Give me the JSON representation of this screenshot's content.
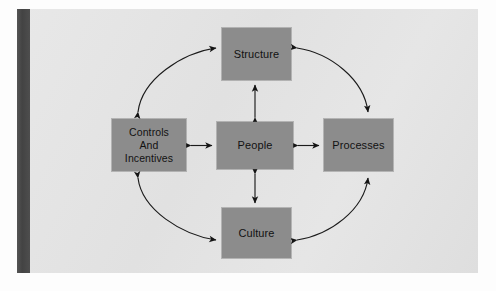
{
  "diagram": {
    "type": "cycle-with-center",
    "page_background": "#e4e4e4",
    "node_fill": "#8c8c8c",
    "node_text_color": "#121212",
    "arrow_color": "#1b1b1b",
    "spine_color": "#4a4a4a",
    "nodes": [
      {
        "id": "structure",
        "label": "Structure",
        "position": "top"
      },
      {
        "id": "controls",
        "label": "Controls\nAnd\nIncentives",
        "position": "left"
      },
      {
        "id": "people",
        "label": "People",
        "position": "center"
      },
      {
        "id": "processes",
        "label": "Processes",
        "position": "right"
      },
      {
        "id": "culture",
        "label": "Culture",
        "position": "bottom"
      }
    ],
    "edges": [
      {
        "from": "people",
        "to": "structure",
        "style": "straight",
        "arrows": "both"
      },
      {
        "from": "people",
        "to": "controls",
        "style": "straight",
        "arrows": "both"
      },
      {
        "from": "people",
        "to": "processes",
        "style": "straight",
        "arrows": "both"
      },
      {
        "from": "people",
        "to": "culture",
        "style": "straight",
        "arrows": "both"
      },
      {
        "from": "controls",
        "to": "structure",
        "style": "curved",
        "arrows": "both"
      },
      {
        "from": "structure",
        "to": "processes",
        "style": "curved",
        "arrows": "both"
      },
      {
        "from": "controls",
        "to": "culture",
        "style": "curved",
        "arrows": "both"
      },
      {
        "from": "culture",
        "to": "processes",
        "style": "curved",
        "arrows": "both"
      }
    ]
  }
}
